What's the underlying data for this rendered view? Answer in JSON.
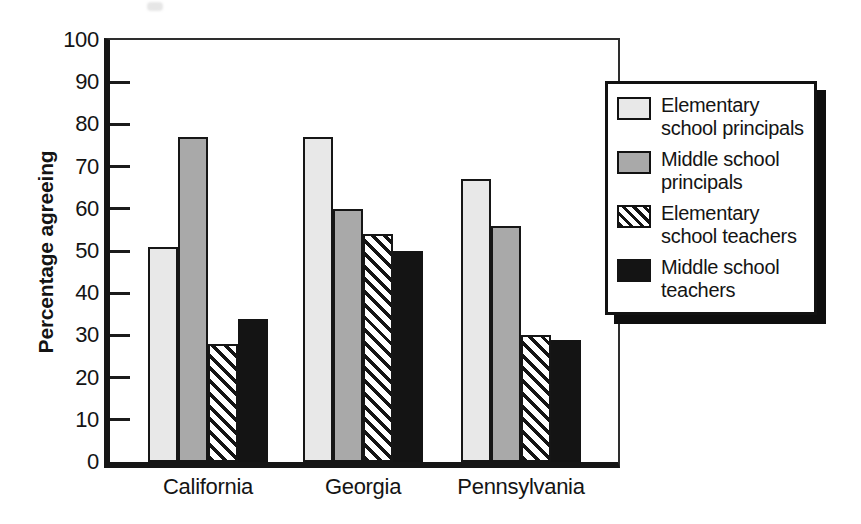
{
  "chart_data": {
    "type": "bar",
    "title": "",
    "xlabel": "",
    "ylabel": "Percentage agreeing",
    "ylim": [
      0,
      100
    ],
    "yticks": [
      0,
      10,
      20,
      30,
      40,
      50,
      60,
      70,
      80,
      90,
      100
    ],
    "grid": false,
    "legend_position": "right",
    "categories": [
      "California",
      "Georgia",
      "Pennsylvania"
    ],
    "series": [
      {
        "name": "Elementary school principals",
        "legend_lines": [
          "Elementary",
          "school principals"
        ],
        "pattern": "solid-light-gray",
        "color": "#e8e8e8",
        "values": [
          51,
          77,
          67
        ]
      },
      {
        "name": "Middle school principals",
        "legend_lines": [
          "Middle school",
          "principals"
        ],
        "pattern": "solid-medium-gray",
        "color": "#a9a9a9",
        "values": [
          77,
          60,
          56
        ]
      },
      {
        "name": "Elementary school teachers",
        "legend_lines": [
          "Elementary",
          "school teachers"
        ],
        "pattern": "diagonal-hatch",
        "color": "#141414",
        "values": [
          28,
          54,
          30
        ]
      },
      {
        "name": "Middle school teachers",
        "legend_lines": [
          "Middle school",
          "teachers"
        ],
        "pattern": "solid-black",
        "color": "#141414",
        "values": [
          34,
          50,
          29
        ]
      }
    ],
    "colors": {
      "outline": "#161616",
      "background": "#ffffff",
      "axis": "#161616"
    }
  }
}
